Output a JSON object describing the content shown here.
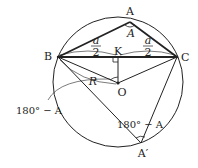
{
  "diagram": {
    "type": "geometry",
    "colors": {
      "stroke": "#222222",
      "background": "#ffffff",
      "label": "#222222"
    },
    "points": {
      "A": {
        "label": "A",
        "x": 130,
        "y": 22
      },
      "B": {
        "label": "B",
        "x": 58,
        "y": 57
      },
      "C": {
        "label": "C",
        "x": 177,
        "y": 57
      },
      "K": {
        "label": "K",
        "x": 118,
        "y": 57
      },
      "O": {
        "label": "O",
        "x": 118,
        "y": 83
      },
      "A2": {
        "label": "A′",
        "x": 141,
        "y": 143
      }
    },
    "circle": {
      "cx": 118,
      "cy": 82,
      "r": 65
    },
    "labels": {
      "angle_A": "A",
      "half_a_left_num": "a",
      "half_a_left_den": "2",
      "half_a_right_num": "a",
      "half_a_right_den": "2",
      "radius": "R",
      "angle_BOK": "180° − A",
      "angle_A2": "180° − A"
    }
  }
}
